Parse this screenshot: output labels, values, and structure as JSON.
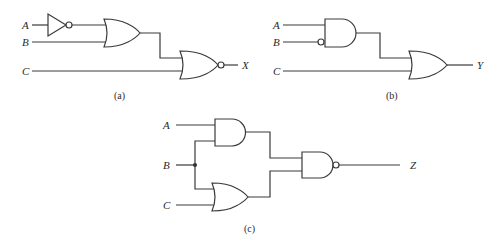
{
  "figure": {
    "type": "logic-circuit-diagrams",
    "panels": [
      {
        "id": "a",
        "caption": "(a)",
        "inputs": [
          "A",
          "B",
          "C"
        ],
        "output": "X",
        "gates": [
          "NOT(A)",
          "OR(NOT A, B)",
          "NOR(OR, C)"
        ],
        "expression": "X = NOR(OR(NOT A, B), C)"
      },
      {
        "id": "b",
        "caption": "(b)",
        "inputs": [
          "A",
          "B",
          "C"
        ],
        "output": "Y",
        "gates": [
          "AND(A, NOT B) with inverted B input",
          "OR(AND, C)"
        ],
        "expression": "Y = OR(AND(A, NOT B), C)"
      },
      {
        "id": "c",
        "caption": "(c)",
        "inputs": [
          "A",
          "B",
          "C"
        ],
        "output": "Z",
        "gates": [
          "AND(A, B)",
          "OR(B, C)",
          "NAND(AND, OR)"
        ],
        "expression": "Z = NAND(AND(A, B), OR(B, C))"
      }
    ]
  },
  "labels": {
    "a": {
      "A": "A",
      "B": "B",
      "C": "C",
      "out": "X",
      "caption": "(a)"
    },
    "b": {
      "A": "A",
      "B": "B",
      "C": "C",
      "out": "Y",
      "caption": "(b)"
    },
    "c": {
      "A": "A",
      "B": "B",
      "C": "C",
      "out": "Z",
      "caption": "(c)"
    }
  }
}
